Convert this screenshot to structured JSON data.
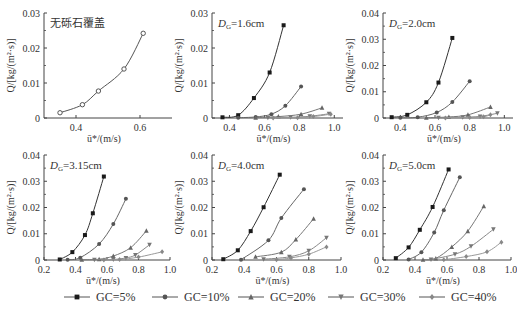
{
  "figure": {
    "legend": [
      {
        "label": "GC=5%",
        "marker": "square",
        "color": "#1a1a1a"
      },
      {
        "label": "GC=10%",
        "marker": "circle",
        "color": "#555555"
      },
      {
        "label": "GC=20%",
        "marker": "triangle-up",
        "color": "#666666"
      },
      {
        "label": "GC=30%",
        "marker": "triangle-down",
        "color": "#777777"
      },
      {
        "label": "GC=40%",
        "marker": "diamond",
        "color": "#888888"
      }
    ]
  },
  "chart_data": [
    {
      "type": "scatter",
      "panel": "a",
      "title": "无砾石覆盖",
      "xlabel": "ū*/(m/s)",
      "ylabel": "Q/[kg/(m²·s)]",
      "xlim": [
        0.3,
        0.7
      ],
      "ylim": [
        0,
        0.03
      ],
      "xticks": [
        0.4,
        0.6
      ],
      "yticks": [
        0,
        0.01,
        0.02,
        0.03
      ],
      "ytick_labels": [
        "0",
        "0.01",
        "0.02",
        "0.03"
      ],
      "series": [
        {
          "name": "no gravel",
          "marker": "open-circle",
          "x": [
            0.35,
            0.42,
            0.47,
            0.55,
            0.61
          ],
          "y": [
            0.0015,
            0.0038,
            0.0077,
            0.014,
            0.0242
          ]
        }
      ]
    },
    {
      "type": "scatter",
      "panel": "b",
      "title": "DG=1.6cm",
      "title_main": "D",
      "title_sub": "G",
      "title_rest": "=1.6cm",
      "xlabel": "ū*/(m/s)",
      "ylabel": "Q/[kg/(m²·s)]",
      "xlim": [
        0.3,
        1.05
      ],
      "ylim": [
        0,
        0.03
      ],
      "xticks": [
        0.4,
        0.6,
        0.8,
        1.0
      ],
      "yticks": [
        0,
        0.01,
        0.02,
        0.03
      ],
      "ytick_labels": [
        "0",
        "0.01",
        "0.02",
        "0.03"
      ],
      "series": [
        {
          "name": "GC=5%",
          "x": [
            0.36,
            0.45,
            0.54,
            0.63,
            0.71
          ],
          "y": [
            0.0002,
            0.0008,
            0.0057,
            0.013,
            0.0265
          ]
        },
        {
          "name": "GC=10%",
          "x": [
            0.45,
            0.55,
            0.64,
            0.72,
            0.81
          ],
          "y": [
            0.0001,
            0.0003,
            0.0011,
            0.0035,
            0.009
          ]
        },
        {
          "name": "GC=20%",
          "x": [
            0.55,
            0.68,
            0.81,
            0.93
          ],
          "y": [
            0.0001,
            0.0004,
            0.0011,
            0.0029
          ]
        },
        {
          "name": "GC=30%",
          "x": [
            0.62,
            0.75,
            0.86,
            0.97
          ],
          "y": [
            0.0001,
            0.0002,
            0.0005,
            0.0012
          ]
        },
        {
          "name": "GC=40%",
          "x": [
            0.65,
            0.79,
            0.88,
            0.98
          ],
          "y": [
            0.0,
            0.0001,
            0.0004,
            0.0011
          ]
        }
      ]
    },
    {
      "type": "scatter",
      "panel": "c",
      "title": "DG=2.0cm",
      "title_main": "D",
      "title_sub": "G",
      "title_rest": "=2.0cm",
      "xlabel": "ū*/(m/s)",
      "ylabel": "Q/[kg/(m²·s)]",
      "xlim": [
        0.3,
        1.05
      ],
      "ylim": [
        0,
        0.04
      ],
      "xticks": [
        0.4,
        0.6,
        0.8,
        1.0
      ],
      "yticks": [
        0,
        0.01,
        0.02,
        0.03,
        0.04
      ],
      "ytick_labels": [
        "0",
        "0.01",
        "0.02",
        "0.03",
        "0.04"
      ],
      "series": [
        {
          "name": "GC=5%",
          "x": [
            0.35,
            0.44,
            0.55,
            0.62,
            0.7
          ],
          "y": [
            0.0003,
            0.0012,
            0.006,
            0.0135,
            0.0305
          ]
        },
        {
          "name": "GC=10%",
          "x": [
            0.4,
            0.5,
            0.61,
            0.7,
            0.8
          ],
          "y": [
            0.0001,
            0.0003,
            0.0021,
            0.0061,
            0.014
          ]
        },
        {
          "name": "GC=20%",
          "x": [
            0.55,
            0.68,
            0.79,
            0.92
          ],
          "y": [
            0.0001,
            0.0004,
            0.0012,
            0.0042
          ]
        },
        {
          "name": "GC=30%",
          "x": [
            0.62,
            0.76,
            0.86,
            0.96
          ],
          "y": [
            0.0001,
            0.0003,
            0.0006,
            0.0018
          ]
        },
        {
          "name": "GC=40%",
          "x": [
            0.66,
            0.8,
            0.88,
            0.92
          ],
          "y": [
            0.0,
            0.0002,
            0.0005,
            0.0012
          ]
        }
      ]
    },
    {
      "type": "scatter",
      "panel": "d",
      "title": "DG=3.15cm",
      "title_main": "D",
      "title_sub": "G",
      "title_rest": "=3.15cm",
      "xlabel": "ū*/(m/s)",
      "ylabel": "Q/[kg/(m²·s)]",
      "xlim": [
        0.2,
        1.0
      ],
      "ylim": [
        0,
        0.04
      ],
      "xticks": [
        0.2,
        0.4,
        0.6,
        0.8,
        1.0
      ],
      "yticks": [
        0,
        0.01,
        0.02,
        0.03,
        0.04
      ],
      "ytick_labels": [
        "0",
        "0.01",
        "0.02",
        "0.03",
        "0.04"
      ],
      "series": [
        {
          "name": "GC=5%",
          "x": [
            0.3,
            0.38,
            0.46,
            0.51,
            0.58
          ],
          "y": [
            0.0002,
            0.003,
            0.0095,
            0.0178,
            0.0318
          ]
        },
        {
          "name": "GC=10%",
          "x": [
            0.35,
            0.43,
            0.55,
            0.64,
            0.72
          ],
          "y": [
            0.0001,
            0.0009,
            0.0061,
            0.0137,
            0.0233
          ]
        },
        {
          "name": "GC=20%",
          "x": [
            0.44,
            0.55,
            0.64,
            0.75,
            0.85
          ],
          "y": [
            0.0001,
            0.0003,
            0.0015,
            0.0047,
            0.0111
          ]
        },
        {
          "name": "GC=30%",
          "x": [
            0.52,
            0.64,
            0.72,
            0.78,
            0.87
          ],
          "y": [
            0.0001,
            0.0002,
            0.0008,
            0.0019,
            0.0058
          ]
        },
        {
          "name": "GC=40%",
          "x": [
            0.58,
            0.68,
            0.8,
            0.95
          ],
          "y": [
            0.0,
            0.0002,
            0.0011,
            0.0031
          ]
        }
      ]
    },
    {
      "type": "scatter",
      "panel": "e",
      "title": "DG=4.0cm",
      "title_main": "D",
      "title_sub": "G",
      "title_rest": "=4.0cm",
      "xlabel": "ū*/(m/s)",
      "ylabel": "Q/[kg/(m²·s)]",
      "xlim": [
        0.2,
        1.0
      ],
      "ylim": [
        0,
        0.04
      ],
      "xticks": [
        0.2,
        0.4,
        0.6,
        0.8,
        1.0
      ],
      "yticks": [
        0,
        0.01,
        0.02,
        0.03,
        0.04
      ],
      "ytick_labels": [
        "0",
        "0.01",
        "0.02",
        "0.03",
        "0.04"
      ],
      "series": [
        {
          "name": "GC=5%",
          "x": [
            0.27,
            0.36,
            0.44,
            0.52,
            0.62
          ],
          "y": [
            0.0003,
            0.0037,
            0.011,
            0.0201,
            0.0325
          ]
        },
        {
          "name": "GC=10%",
          "x": [
            0.38,
            0.55,
            0.63,
            0.77
          ],
          "y": [
            0.0001,
            0.0075,
            0.016,
            0.027
          ]
        },
        {
          "name": "GC=20%",
          "x": [
            0.47,
            0.63,
            0.72,
            0.83
          ],
          "y": [
            0.0012,
            0.003,
            0.0078,
            0.0157
          ]
        },
        {
          "name": "GC=30%",
          "x": [
            0.52,
            0.68,
            0.8,
            0.91
          ],
          "y": [
            0.0003,
            0.0012,
            0.0035,
            0.0085
          ]
        },
        {
          "name": "GC=40%",
          "x": [
            0.6,
            0.69,
            0.8,
            0.91
          ],
          "y": [
            0.0001,
            0.0008,
            0.0022,
            0.005
          ]
        }
      ]
    },
    {
      "type": "scatter",
      "panel": "f",
      "title": "DG=5.0cm",
      "title_main": "D",
      "title_sub": "G",
      "title_rest": "=5.0cm",
      "xlabel": "ū*/(m/s)",
      "ylabel": "Q/[kg/(m²·s)]",
      "xlim": [
        0.2,
        1.0
      ],
      "ylim": [
        0,
        0.04
      ],
      "xticks": [
        0.2,
        0.4,
        0.6,
        0.8,
        1.0
      ],
      "yticks": [
        0,
        0.01,
        0.02,
        0.03,
        0.04
      ],
      "ytick_labels": [
        "0",
        "0.01",
        "0.02",
        "0.03",
        "0.04"
      ],
      "series": [
        {
          "name": "GC=5%",
          "x": [
            0.28,
            0.36,
            0.43,
            0.51,
            0.61
          ],
          "y": [
            0.0007,
            0.0048,
            0.0115,
            0.0202,
            0.0345
          ]
        },
        {
          "name": "GC=10%",
          "x": [
            0.36,
            0.44,
            0.52,
            0.58,
            0.68
          ],
          "y": [
            0.0002,
            0.003,
            0.0105,
            0.019,
            0.0315
          ]
        },
        {
          "name": "GC=20%",
          "x": [
            0.45,
            0.53,
            0.63,
            0.73,
            0.83
          ],
          "y": [
            0.0001,
            0.0006,
            0.005,
            0.011,
            0.0205
          ]
        },
        {
          "name": "GC=30%",
          "x": [
            0.5,
            0.65,
            0.75,
            0.89
          ],
          "y": [
            0.0002,
            0.0022,
            0.0052,
            0.0117
          ]
        },
        {
          "name": "GC=40%",
          "x": [
            0.58,
            0.72,
            0.85,
            0.94
          ],
          "y": [
            0.0001,
            0.0013,
            0.0031,
            0.0068
          ]
        }
      ]
    }
  ]
}
